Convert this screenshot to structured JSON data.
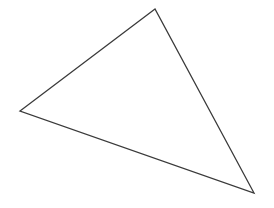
{
  "figure": {
    "background_color": "#ffffff",
    "width": 274,
    "height": 208
  },
  "shape": {
    "name": "triangle",
    "type": "polygon",
    "stroke_color": "#3a3a3a",
    "stroke_width": 1.3,
    "fill_color": "none",
    "vertices": [
      {
        "label": "apex-top",
        "x": 155,
        "y": 9
      },
      {
        "label": "vertex-left",
        "x": 20,
        "y": 111
      },
      {
        "label": "vertex-bottom-right",
        "x": 254,
        "y": 193
      }
    ],
    "edges": [
      {
        "label": "edge-top-left",
        "from": "apex-top",
        "to": "vertex-left"
      },
      {
        "label": "edge-bottom",
        "from": "vertex-left",
        "to": "vertex-bottom-right"
      },
      {
        "label": "edge-right",
        "from": "vertex-bottom-right",
        "to": "apex-top"
      }
    ]
  }
}
